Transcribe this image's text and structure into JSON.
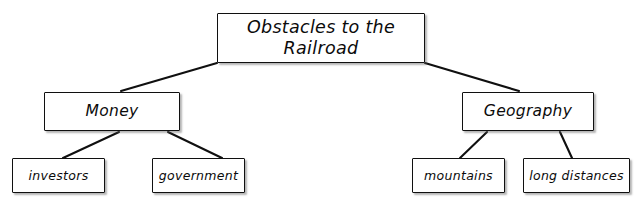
{
  "diagram": {
    "type": "hierarchy-tree",
    "title": "Obstacles to the Railroad",
    "orientation": "top-down",
    "levels": 3,
    "colors": {
      "background": "#ffffff",
      "box_fill": "#ffffff",
      "box_border": "#101010",
      "text": "#0b0b0b",
      "connector": "#101010"
    },
    "root": {
      "label": "Obstacles to the\nRailroad"
    },
    "branches": [
      {
        "label": "Money"
      },
      {
        "label": "Geography"
      }
    ],
    "leaves": [
      {
        "label": "investors"
      },
      {
        "label": "government"
      },
      {
        "label": "mountains"
      },
      {
        "label": "long distances"
      }
    ]
  }
}
